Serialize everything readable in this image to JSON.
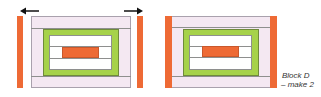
{
  "diagram": {
    "title": "Block D",
    "caption_line1": "Block D",
    "caption_line2": "– make 2",
    "colors": {
      "orange": "#ee6a35",
      "green": "#a6d24a",
      "pink": "#f4e8f2",
      "white": "#ffffff",
      "outline": "#8e8f8e"
    },
    "blocks": [
      {
        "name": "exploded-block",
        "arrows": [
          "left-arrow",
          "right-arrow"
        ]
      },
      {
        "name": "assembled-block"
      }
    ]
  }
}
